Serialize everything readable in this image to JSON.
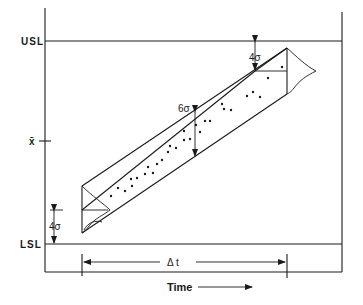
{
  "diagram": {
    "labels": {
      "usl": "USL",
      "lsl": "LSL",
      "xbar": "x̄",
      "upper_margin": "4σ",
      "lower_margin": "4σ",
      "spread": "6σ",
      "delta_t": "Δ t",
      "time_axis": "Time"
    },
    "colors": {
      "line": "#1a1a1a",
      "background": "#ffffff"
    }
  }
}
